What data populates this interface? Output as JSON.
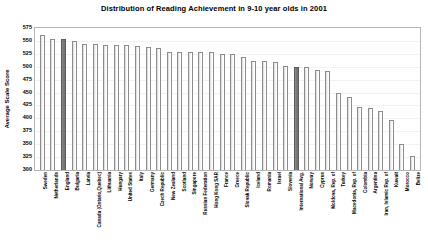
{
  "chart_data": {
    "type": "bar",
    "title": "Distribution of Reading Achievement in 9-10 year olds in 2001",
    "xlabel": "",
    "ylabel": "Average Scale Score",
    "ylim": [
      300,
      575
    ],
    "ytick_step": 25,
    "yticks": [
      575,
      550,
      525,
      500,
      475,
      450,
      425,
      400,
      375,
      350,
      325,
      300
    ],
    "grid": true,
    "legend": "none",
    "highlight_color": "#7a7a7a",
    "bar_color": "#ffffff",
    "bar_border_color": "#8c8c8c",
    "highlighted_categories": [
      "England",
      "International Avg."
    ],
    "categories": [
      "Sweden",
      "Netherlands",
      "England",
      "Bulgaria",
      "Latvia",
      "Canada (Ontario,Quebec)",
      "Lithuania",
      "Hungary",
      "United States",
      "Italy",
      "Germany",
      "Czech Republic",
      "New Zealand",
      "Scotland",
      "Singapore",
      "Russian Federation",
      "Hong Kong SAR",
      "France",
      "Greece",
      "Slovak Republic",
      "Iceland",
      "Romania",
      "Israel",
      "Slovenia",
      "International Avg.",
      "Norway",
      "Cyprus",
      "Moldova, Rep. of",
      "Turkey",
      "Macedonia, Rep. of",
      "Colombia",
      "Argentina",
      "Iran, Islamic Rep. of",
      "Kuwait",
      "Morocco",
      "Belize"
    ],
    "values": [
      561,
      554,
      553,
      550,
      545,
      544,
      543,
      543,
      542,
      541,
      539,
      537,
      529,
      528,
      528,
      528,
      528,
      525,
      524,
      518,
      512,
      512,
      509,
      502,
      500,
      499,
      494,
      492,
      449,
      442,
      422,
      420,
      414,
      396,
      350,
      327
    ]
  }
}
